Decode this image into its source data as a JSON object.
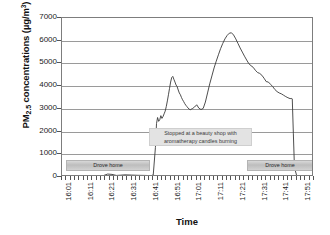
{
  "chart_data": {
    "type": "line",
    "title": "",
    "xlabel": "Time",
    "ylabel": "PM2.5 concentrations (µg/m³)",
    "ylabel_parts": {
      "prefix": "PM",
      "subscript": "2.5",
      "middle": " concentrations (µg/m",
      "superscript": "3",
      "suffix": ")"
    },
    "ylim": [
      0,
      7000
    ],
    "ytick_labels": [
      "7000",
      "6000",
      "5000",
      "4000",
      "3000",
      "2000",
      "1000",
      "0"
    ],
    "ytick_values": [
      7000,
      6000,
      5000,
      4000,
      3000,
      2000,
      1000,
      0
    ],
    "grid": "horizontal",
    "legend": "none",
    "xtick_labels": [
      "16:01",
      "16:11",
      "16:21",
      "16:31",
      "16:41",
      "16:51",
      "17:01",
      "17:11",
      "17:21",
      "17:31",
      "17:41",
      "17:51"
    ],
    "xlim_minutes": [
      961,
      1077
    ],
    "line_color": "#3a3a3a",
    "line_width": 0.9,
    "x_minutes": [
      961,
      965,
      969,
      973,
      977,
      980,
      982,
      984,
      986,
      988,
      990,
      993,
      996,
      999,
      1002,
      1003,
      1004,
      1004.5,
      1005,
      1005.5,
      1006,
      1006.5,
      1007,
      1007.5,
      1008,
      1008.5,
      1009,
      1009.5,
      1010,
      1010.5,
      1011,
      1011.5,
      1012,
      1012.5,
      1013,
      1013.5,
      1014,
      1014.5,
      1015,
      1015.5,
      1016,
      1016.5,
      1017,
      1017.5,
      1018,
      1018.5,
      1019,
      1019.5,
      1020,
      1021,
      1022,
      1023,
      1024,
      1025,
      1026,
      1027,
      1028,
      1029,
      1030,
      1031,
      1032,
      1033,
      1034,
      1035,
      1036,
      1037,
      1038,
      1039,
      1040,
      1041,
      1042,
      1043,
      1044,
      1045,
      1046,
      1047,
      1048,
      1049,
      1050,
      1051,
      1052,
      1053,
      1054,
      1055,
      1056,
      1057,
      1058,
      1059,
      1060,
      1061,
      1062,
      1063,
      1064,
      1065,
      1066,
      1066.5,
      1067,
      1067.5,
      1068,
      1069,
      1071,
      1073,
      1075,
      1077
    ],
    "y_values": [
      40,
      45,
      42,
      48,
      50,
      60,
      130,
      115,
      70,
      80,
      95,
      85,
      75,
      70,
      60,
      90,
      1300,
      2350,
      2620,
      2450,
      2520,
      2700,
      2580,
      2660,
      2780,
      2900,
      3100,
      3350,
      3620,
      3900,
      4180,
      4380,
      4430,
      4300,
      4180,
      4050,
      3980,
      3830,
      3700,
      3620,
      3500,
      3400,
      3320,
      3230,
      3160,
      3100,
      3040,
      2990,
      2960,
      3010,
      3080,
      3180,
      3030,
      2970,
      3020,
      3300,
      3700,
      4100,
      4450,
      4800,
      5100,
      5380,
      5650,
      5880,
      6080,
      6230,
      6330,
      6350,
      6250,
      6080,
      5880,
      5680,
      5500,
      5320,
      5150,
      4990,
      4900,
      4830,
      4700,
      4600,
      4560,
      4480,
      4350,
      4200,
      4180,
      4080,
      3980,
      3850,
      3760,
      3700,
      3660,
      3600,
      3540,
      3490,
      3450,
      3460,
      3440,
      1900,
      420,
      70,
      50,
      45,
      60,
      55,
      40
    ],
    "peak_value": 6350,
    "first_spike_value": 4430,
    "drop_value": 3450,
    "baseline_value": 50
  },
  "annotations": {
    "shop": "Stopped at a beauty shop with aromatherapy candles burning",
    "drove_home_left": "Drove home",
    "drove_home_right": "Drove home"
  }
}
